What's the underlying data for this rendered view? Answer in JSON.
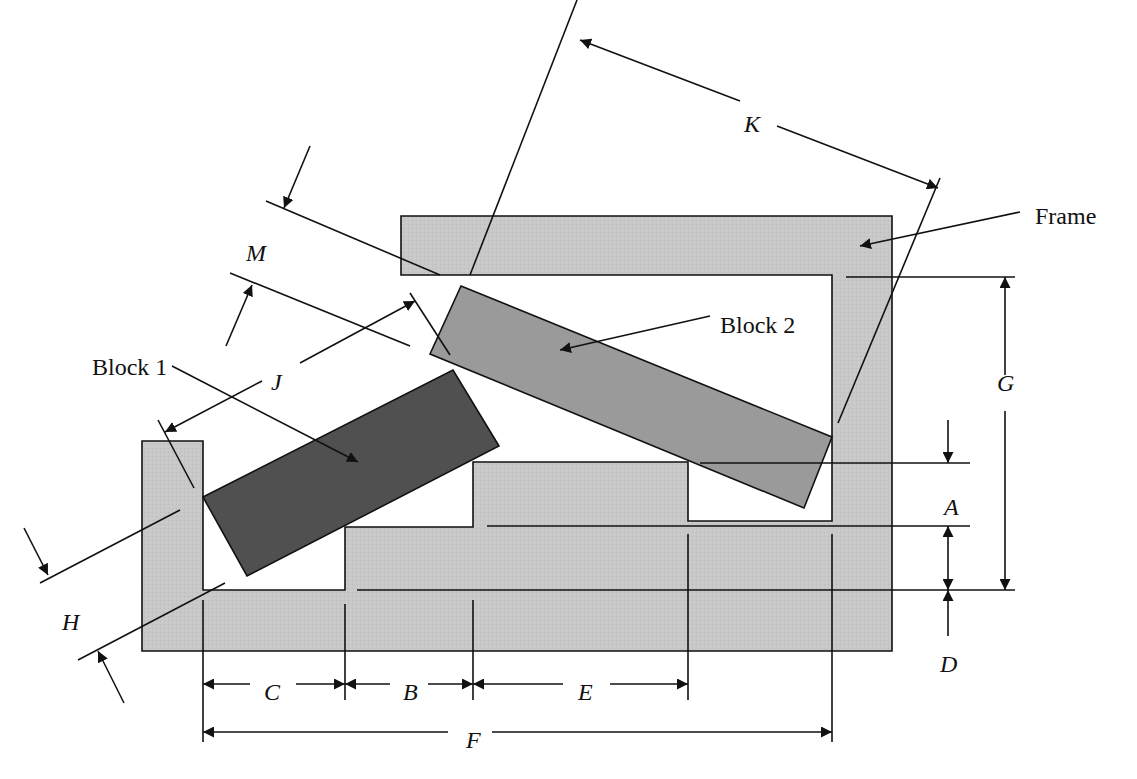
{
  "diagram": {
    "colors": {
      "frame_fill": "#c8c8c8",
      "block1_fill": "#505050",
      "block2_fill": "#9a9a9a",
      "line": "#111111",
      "background": "#ffffff"
    },
    "components": {
      "frame": {
        "label": "Frame",
        "label_pos": [
          1035,
          224
        ],
        "leader": [
          [
            1020,
            212
          ],
          [
            860,
            246
          ]
        ],
        "polygon": [
          [
            401,
            216
          ],
          [
            892,
            216
          ],
          [
            892,
            651
          ],
          [
            142,
            651
          ],
          [
            142,
            441
          ],
          [
            203,
            441
          ],
          [
            203,
            590
          ],
          [
            345,
            590
          ],
          [
            345,
            527
          ],
          [
            473,
            527
          ],
          [
            473,
            462
          ],
          [
            688,
            462
          ],
          [
            688,
            521
          ],
          [
            832,
            521
          ],
          [
            832,
            275
          ],
          [
            401,
            275
          ]
        ]
      },
      "block1": {
        "label": "Block 1",
        "label_pos": [
          92,
          375
        ],
        "leader": [
          [
            172,
            366
          ],
          [
            358,
            462
          ]
        ],
        "polygon": [
          [
            203,
            497
          ],
          [
            453,
            370
          ],
          [
            499,
            446
          ],
          [
            247,
            576
          ]
        ]
      },
      "block2": {
        "label": "Block 2",
        "label_pos": [
          720,
          333
        ],
        "leader": [
          [
            710,
            316
          ],
          [
            560,
            350
          ]
        ],
        "polygon": [
          [
            461,
            286
          ],
          [
            832,
            437
          ],
          [
            804,
            508
          ],
          [
            430,
            354
          ]
        ]
      }
    },
    "dimensions": [
      {
        "id": "A",
        "label": "A",
        "label_pos": [
          944,
          515
        ]
      },
      {
        "id": "B",
        "label": "B",
        "label_pos": [
          403,
          700
        ]
      },
      {
        "id": "C",
        "label": "C",
        "label_pos": [
          264,
          700
        ]
      },
      {
        "id": "D",
        "label": "D",
        "label_pos": [
          940,
          672
        ]
      },
      {
        "id": "E",
        "label": "E",
        "label_pos": [
          578,
          700
        ]
      },
      {
        "id": "F",
        "label": "F",
        "label_pos": [
          466,
          748
        ]
      },
      {
        "id": "G",
        "label": "G",
        "label_pos": [
          997,
          391
        ]
      },
      {
        "id": "H",
        "label": "H",
        "label_pos": [
          62,
          630
        ]
      },
      {
        "id": "J",
        "label": "J",
        "label_pos": [
          271,
          390
        ]
      },
      {
        "id": "K",
        "label": "K",
        "label_pos": [
          744,
          132
        ]
      },
      {
        "id": "M",
        "label": "M",
        "label_pos": [
          246,
          261
        ]
      }
    ],
    "extension_lines": [
      [
        [
          577,
          0
        ],
        [
          470,
          275
        ]
      ],
      [
        [
          940,
          178
        ],
        [
          838,
          423
        ]
      ],
      [
        [
          846,
          277
        ],
        [
          1015,
          277
        ]
      ],
      [
        [
          700,
          463
        ],
        [
          970,
          463
        ]
      ],
      [
        [
          487,
          526
        ],
        [
          970,
          526
        ]
      ],
      [
        [
          357,
          590
        ],
        [
          1015,
          590
        ]
      ],
      [
        [
          203,
          600
        ],
        [
          203,
          742
        ]
      ],
      [
        [
          345,
          604
        ],
        [
          345,
          700
        ]
      ],
      [
        [
          473,
          600
        ],
        [
          473,
          700
        ]
      ],
      [
        [
          688,
          534
        ],
        [
          688,
          700
        ]
      ],
      [
        [
          832,
          534
        ],
        [
          832,
          742
        ]
      ],
      [
        [
          266,
          201
        ],
        [
          440,
          275
        ]
      ],
      [
        [
          230,
          273
        ],
        [
          410,
          346
        ]
      ],
      [
        [
          410,
          293
        ],
        [
          450,
          355
        ]
      ],
      [
        [
          158,
          420
        ],
        [
          194,
          488
        ]
      ],
      [
        [
          40,
          583
        ],
        [
          180,
          510
        ]
      ],
      [
        [
          78,
          660
        ],
        [
          225,
          583
        ]
      ]
    ],
    "arrows": [
      {
        "dim": "K",
        "from": [
          740,
          101
        ],
        "to": [
          580,
          40
        ]
      },
      {
        "dim": "K",
        "from": [
          777,
          126
        ],
        "to": [
          938,
          188
        ]
      },
      {
        "dim": "G",
        "from": [
          1005,
          375
        ],
        "to": [
          1005,
          277
        ]
      },
      {
        "dim": "G",
        "from": [
          1005,
          411
        ],
        "to": [
          1005,
          590
        ]
      },
      {
        "dim": "A",
        "from": [
          948,
          420
        ],
        "to": [
          948,
          463
        ]
      },
      {
        "dim": "A",
        "from": [
          948,
          558
        ],
        "to": [
          948,
          526
        ]
      },
      {
        "dim": "A",
        "from": [
          948,
          558
        ],
        "to": [
          948,
          590
        ]
      },
      {
        "dim": "D",
        "from": [
          948,
          636
        ],
        "to": [
          948,
          590
        ]
      },
      {
        "dim": "C",
        "from": [
          250,
          684
        ],
        "to": [
          203,
          684
        ]
      },
      {
        "dim": "C",
        "from": [
          296,
          684
        ],
        "to": [
          345,
          684
        ]
      },
      {
        "dim": "B",
        "from": [
          390,
          684
        ],
        "to": [
          345,
          684
        ]
      },
      {
        "dim": "B",
        "from": [
          428,
          684
        ],
        "to": [
          473,
          684
        ]
      },
      {
        "dim": "E",
        "from": [
          563,
          684
        ],
        "to": [
          473,
          684
        ]
      },
      {
        "dim": "E",
        "from": [
          610,
          684
        ],
        "to": [
          688,
          684
        ]
      },
      {
        "dim": "F",
        "from": [
          448,
          732
        ],
        "to": [
          203,
          732
        ]
      },
      {
        "dim": "F",
        "from": [
          492,
          732
        ],
        "to": [
          832,
          732
        ]
      },
      {
        "dim": "J",
        "from": [
          300,
          363
        ],
        "to": [
          415,
          301
        ]
      },
      {
        "dim": "J",
        "from": [
          262,
          381
        ],
        "to": [
          165,
          432
        ]
      },
      {
        "dim": "M",
        "from": [
          310,
          146
        ],
        "to": [
          284,
          208
        ]
      },
      {
        "dim": "M",
        "from": [
          226,
          346
        ],
        "to": [
          252,
          285
        ]
      },
      {
        "dim": "H",
        "from": [
          24,
          528
        ],
        "to": [
          48,
          575
        ]
      },
      {
        "dim": "H",
        "from": [
          124,
          703
        ],
        "to": [
          98,
          651
        ]
      }
    ]
  }
}
